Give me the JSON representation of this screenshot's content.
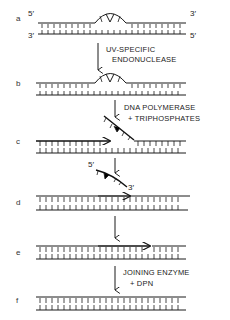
{
  "figure": {
    "panels": [
      {
        "id": "a",
        "label": "a"
      },
      {
        "id": "b",
        "label": "b"
      },
      {
        "id": "c",
        "label": "c"
      },
      {
        "id": "d",
        "label": "d"
      },
      {
        "id": "e",
        "label": "e"
      },
      {
        "id": "f",
        "label": "f"
      }
    ],
    "strand_ends": {
      "top_left": "5′",
      "top_right": "3′",
      "bottom_left": "3′",
      "bottom_right": "5′"
    },
    "excised_fragment_ends": {
      "left": "5′",
      "right": "3′"
    },
    "steps": [
      {
        "from": "a",
        "to": "b",
        "line1": "UV-SPECIFIC",
        "line2": "ENDONUCLEASE"
      },
      {
        "from": "b",
        "to": "c",
        "line1": "DNA POLYMERASE",
        "line2": "+ TRIPHOSPHATES"
      },
      {
        "from": "c",
        "to": "d",
        "line1": "",
        "line2": ""
      },
      {
        "from": "d",
        "to": "e",
        "line1": "",
        "line2": ""
      },
      {
        "from": "e",
        "to": "f",
        "line1": "JOINING ENZYME",
        "line2": "+ DPN"
      }
    ],
    "colors": {
      "ink": "#1a1a1a",
      "background": "#ffffff"
    }
  }
}
